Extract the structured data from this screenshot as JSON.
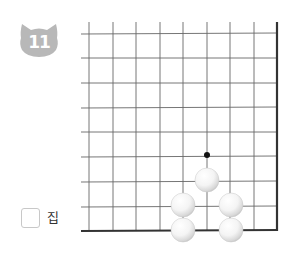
{
  "problem": {
    "number": "11",
    "badge_icon": "cat-head-icon",
    "badge_color": "#b8b8b8"
  },
  "answer": {
    "unit_label": "집",
    "value": ""
  },
  "board": {
    "grid_color": "#555555",
    "edge_color": "#333333",
    "columns": 9,
    "rows": 9,
    "edges": [
      "right",
      "bottom"
    ],
    "stones": [
      {
        "color": "white",
        "col": 5,
        "row": 6
      },
      {
        "color": "white",
        "col": 4,
        "row": 7
      },
      {
        "color": "white",
        "col": 6,
        "row": 7
      },
      {
        "color": "white",
        "col": 4,
        "row": 8
      },
      {
        "color": "white",
        "col": 6,
        "row": 8
      }
    ],
    "markers": [
      {
        "type": "dot",
        "color": "#111111",
        "col": 5,
        "row": 5
      }
    ]
  }
}
